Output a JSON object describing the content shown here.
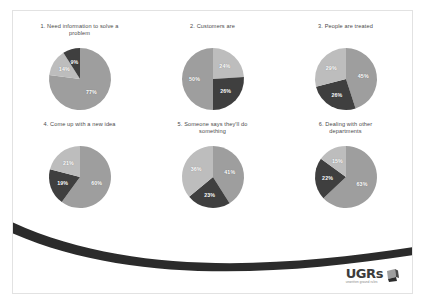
{
  "slide": {
    "background_color": "#ffffff",
    "border_color": "#e2e2e2",
    "swoosh_color": "#2b2b2b"
  },
  "palette": {
    "slice_a": "#9e9e9e",
    "slice_b": "#3f3f3f",
    "slice_c": "#bdbdbd",
    "label_color": "#ffffff",
    "title_color": "#4a4a4a"
  },
  "logo": {
    "word": "UGRs",
    "tagline": "unwritten ground rules",
    "mark": "flag-swoosh-mark"
  },
  "chart_data": [
    {
      "type": "pie",
      "title": "1. Need information to solve a problem",
      "categories": [
        "Slice A",
        "Slice B",
        "Slice C"
      ],
      "values": [
        77,
        14,
        9
      ],
      "labels": [
        "77%",
        "14%",
        "9%"
      ],
      "colors": [
        "#9e9e9e",
        "#bdbdbd",
        "#3f3f3f"
      ],
      "legend": "none"
    },
    {
      "type": "pie",
      "title": "2. Customers are",
      "categories": [
        "Slice A",
        "Slice B",
        "Slice C"
      ],
      "values": [
        24,
        26,
        50
      ],
      "labels": [
        "24%",
        "26%",
        "50%"
      ],
      "colors": [
        "#bdbdbd",
        "#3f3f3f",
        "#9e9e9e"
      ],
      "legend": "none"
    },
    {
      "type": "pie",
      "title": "3. People are treated",
      "categories": [
        "Slice A",
        "Slice B",
        "Slice C"
      ],
      "values": [
        45,
        26,
        29
      ],
      "labels": [
        "45%",
        "26%",
        "29%"
      ],
      "colors": [
        "#9e9e9e",
        "#3f3f3f",
        "#bdbdbd"
      ],
      "legend": "none"
    },
    {
      "type": "pie",
      "title": "4. Come up with a new idea",
      "categories": [
        "Slice A",
        "Slice B",
        "Slice C"
      ],
      "values": [
        60,
        19,
        21
      ],
      "labels": [
        "60%",
        "19%",
        "21%"
      ],
      "colors": [
        "#9e9e9e",
        "#3f3f3f",
        "#bdbdbd"
      ],
      "legend": "none"
    },
    {
      "type": "pie",
      "title": "5. Someone says they'll do something",
      "categories": [
        "Slice A",
        "Slice B",
        "Slice C"
      ],
      "values": [
        41,
        23,
        36
      ],
      "labels": [
        "41%",
        "23%",
        "36%"
      ],
      "colors": [
        "#9e9e9e",
        "#3f3f3f",
        "#bdbdbd"
      ],
      "legend": "none"
    },
    {
      "type": "pie",
      "title": "6. Dealing with other departments",
      "categories": [
        "Slice A",
        "Slice B",
        "Slice C"
      ],
      "values": [
        63,
        22,
        15
      ],
      "labels": [
        "63%",
        "22%",
        "15%"
      ],
      "colors": [
        "#9e9e9e",
        "#3f3f3f",
        "#bdbdbd"
      ],
      "legend": "none"
    }
  ]
}
